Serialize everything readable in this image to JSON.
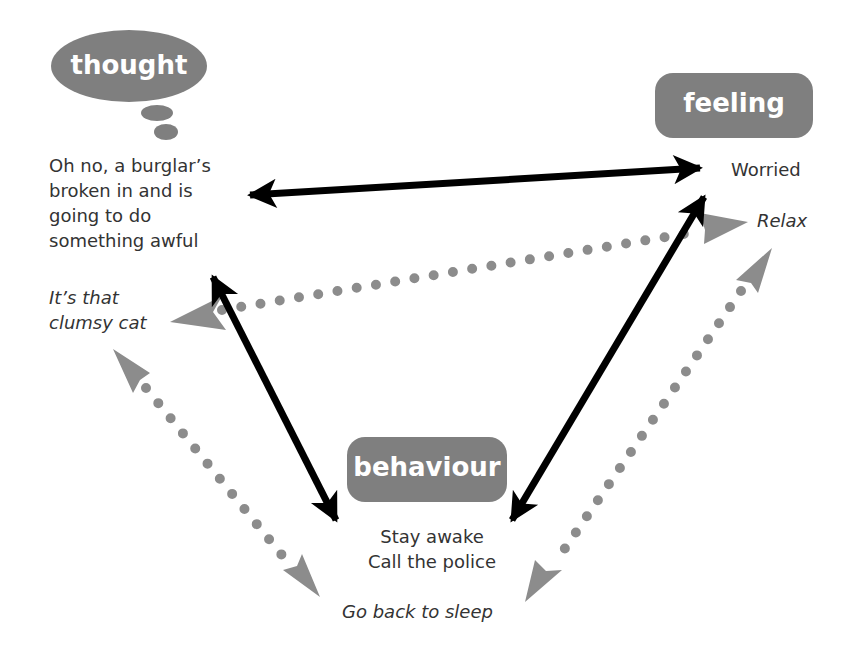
{
  "colors": {
    "node_fill": "#7f7f7f",
    "solid_arrow": "#000000",
    "dotted_arrow": "#8c8c8c",
    "text": "#333333",
    "background": "#ffffff"
  },
  "nodes": {
    "thought": {
      "label": "thought",
      "shape": "thought-bubble",
      "text_lines": [
        "Oh no, a burglar’s",
        "broken in and is",
        "going to do",
        "something awful"
      ],
      "alternative_lines": [
        "It’s that",
        "clumsy cat"
      ]
    },
    "feeling": {
      "label": "feeling",
      "shape": "rounded-rect",
      "text_lines": [
        "Worried"
      ],
      "alternative_lines": [
        "Relax"
      ]
    },
    "behaviour": {
      "label": "behaviour",
      "shape": "rounded-rect",
      "text_lines": [
        "Stay awake",
        "Call the police"
      ],
      "alternative_lines": [
        "Go back to sleep"
      ]
    }
  },
  "connections": [
    {
      "from": "thought",
      "to": "feeling",
      "style": "solid",
      "direction": "both"
    },
    {
      "from": "thought",
      "to": "behaviour",
      "style": "solid",
      "direction": "both"
    },
    {
      "from": "feeling",
      "to": "behaviour",
      "style": "solid",
      "direction": "both"
    },
    {
      "from": "thought-alt",
      "to": "feeling-alt",
      "style": "dotted",
      "direction": "both"
    },
    {
      "from": "thought-alt",
      "to": "behaviour-alt",
      "style": "dotted",
      "direction": "both"
    },
    {
      "from": "feeling-alt",
      "to": "behaviour-alt",
      "style": "dotted",
      "direction": "both"
    }
  ]
}
